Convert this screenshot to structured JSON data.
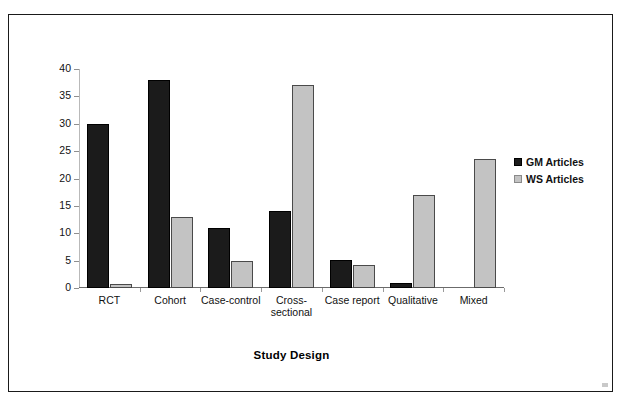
{
  "chart_data": {
    "type": "bar",
    "title": "",
    "xlabel": "Study Design",
    "ylabel": "%",
    "ylim": [
      0,
      40
    ],
    "ytick_step": 5,
    "yticks": [
      "40",
      "35",
      "30",
      "25",
      "20",
      "15",
      "10",
      "5",
      "0"
    ],
    "grid": false,
    "legend_position": "right",
    "categories": [
      "RCT",
      "Cohort",
      "Case-control",
      "Cross-\nsectional",
      "Case report",
      "Qualitative",
      "Mixed"
    ],
    "series": [
      {
        "name": "GM Articles",
        "color": "#1b1b1b",
        "values": [
          30,
          38,
          11,
          14,
          5.2,
          1,
          0
        ]
      },
      {
        "name": "WS Articles",
        "color": "#c3c3c3",
        "values": [
          0.8,
          13,
          5,
          37,
          4.2,
          17,
          23.5
        ]
      }
    ]
  },
  "legend": {
    "items": [
      {
        "label": "GM Articles",
        "swatch": "black-square-icon"
      },
      {
        "label": "WS Articles",
        "swatch": "gray-square-icon"
      }
    ]
  }
}
